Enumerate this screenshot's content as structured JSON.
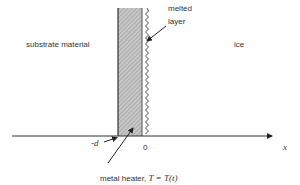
{
  "diagram": {
    "regions": {
      "substrate": "substrate material",
      "ice": "ice"
    },
    "annotations": {
      "melted_layer_line1": "melted",
      "melted_layer_line2": "layer",
      "heater_label": "metal heater,",
      "heater_equation": "T = T(t)"
    },
    "axis": {
      "label": "x",
      "ticks": [
        "-d",
        "0"
      ]
    },
    "colors": {
      "ink": "#222222",
      "hatch_fill": "#bdbdbd"
    }
  }
}
